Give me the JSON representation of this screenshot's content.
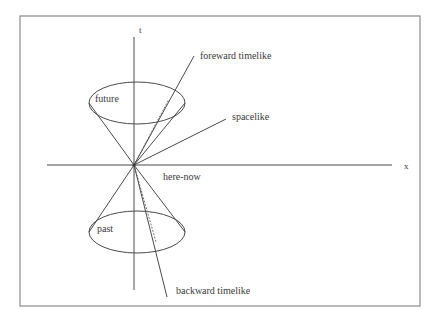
{
  "figure": {
    "frame": {
      "x": 20,
      "y": 16,
      "width": 400,
      "height": 290,
      "stroke": "#8c8c8c",
      "stroke_width": 1.2
    },
    "background_color": "#ffffff",
    "line_color": "#4a4a4a",
    "text_color": "#3a3a3a"
  },
  "axes": {
    "origin": {
      "x": 134,
      "y": 165
    },
    "t_axis": {
      "label": "t",
      "label_x": 139,
      "label_y": 31,
      "x": 134,
      "y1": 37,
      "y2": 290
    },
    "x_axis": {
      "label": "x",
      "label_x": 404,
      "label_y": 167,
      "y": 165,
      "x1": 47,
      "x2": 392
    }
  },
  "cones": {
    "future": {
      "label": "future",
      "label_x": 95,
      "label_y": 99,
      "ellipse": {
        "cx": 137,
        "cy": 103,
        "rx": 48,
        "ry": 21
      },
      "left_edge": {
        "x1": 134,
        "y1": 165,
        "x2": 89,
        "y2": 103
      },
      "right_edge": {
        "x1": 134,
        "y1": 165,
        "x2": 185,
        "y2": 103
      }
    },
    "past": {
      "label": "past",
      "label_x": 97,
      "label_y": 229,
      "ellipse": {
        "cx": 137,
        "cy": 232,
        "rx": 48,
        "ry": 21
      },
      "left_edge": {
        "x1": 134,
        "y1": 165,
        "x2": 89,
        "y2": 232
      },
      "right_edge": {
        "x1": 134,
        "y1": 165,
        "x2": 185,
        "y2": 232
      }
    }
  },
  "rays": [
    {
      "name": "foreward-timelike",
      "label": "foreward timelike",
      "label_x": 200,
      "label_y": 57,
      "line": {
        "x1": 134,
        "y1": 165,
        "x2": 194,
        "y2": 56
      },
      "style": "solid"
    },
    {
      "name": "spacelike",
      "label": "spacelike",
      "label_x": 232,
      "label_y": 117,
      "line": {
        "x1": 134,
        "y1": 165,
        "x2": 226,
        "y2": 119
      },
      "style": "solid"
    },
    {
      "name": "backward-timelike",
      "label": "backward timelike",
      "label_x": 176,
      "label_y": 291,
      "line": {
        "x1": 134,
        "y1": 165,
        "x2": 167,
        "y2": 297
      },
      "style": "solid"
    },
    {
      "name": "null-dotted-upper",
      "label": "",
      "line": {
        "x1": 134,
        "y1": 165,
        "x2": 169,
        "y2": 99
      },
      "style": "dotted"
    },
    {
      "name": "null-dotted-lower",
      "label": "",
      "line": {
        "x1": 134,
        "y1": 165,
        "x2": 156,
        "y2": 242
      },
      "style": "dotted"
    }
  ],
  "origin_point": {
    "label": "here-now",
    "label_x": 163,
    "label_y": 177
  }
}
